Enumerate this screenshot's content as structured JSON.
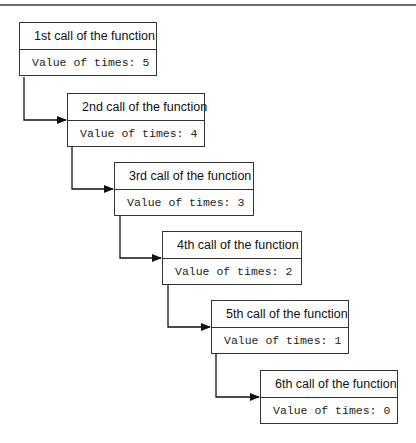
{
  "diagram": {
    "type": "recursion-call-stack",
    "calls": [
      {
        "title": "1st call of the function",
        "value": "Value of times: 5"
      },
      {
        "title": "2nd call of the function",
        "value": "Value of times: 4"
      },
      {
        "title": "3rd call of the function",
        "value": "Value of times: 3"
      },
      {
        "title": "4th call of the function",
        "value": "Value of times: 2"
      },
      {
        "title": "5th call of the function",
        "value": "Value of times: 1"
      },
      {
        "title": "6th call of the function",
        "value": "Value of times: 0"
      }
    ],
    "colors": {
      "stroke": "#333333",
      "background": "#ffffff",
      "rule": "#6e6e6e"
    }
  }
}
